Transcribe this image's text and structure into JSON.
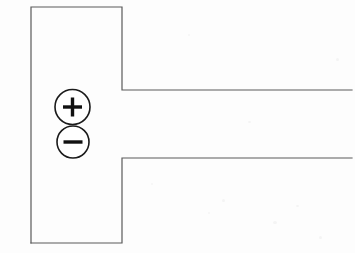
{
  "canvas": {
    "width": 355,
    "height": 253,
    "background_color": "#fdfdfd",
    "stroke_color": "#5a5a5a",
    "symbol_color": "#111111",
    "stroke_width": 1.2,
    "circle_stroke_width": 1.6,
    "description": "Scanned line drawing of an open T-shaped outline with plus and minus control circles"
  },
  "diagram": {
    "outline": {
      "name": "t-shaped-outline",
      "top_path": "M 31 243 L 31 7 L 122 7 L 122 90 L 352 90",
      "bottom_path": "M 31 243 L 122 243 L 122 158 L 352 158",
      "vertical_bar": {
        "left": 31,
        "top": 7,
        "right": 122,
        "bottom": 243
      },
      "top_arm": {
        "y": 90,
        "x_start": 122,
        "x_end": 352
      },
      "bottom_arm": {
        "y": 158,
        "x_start": 122,
        "x_end": 352
      },
      "gap_note": "right edge of the vertical bar is open between y=90 and y=158"
    },
    "controls": [
      {
        "name": "zoom-in-button",
        "symbol": "plus",
        "label": "+",
        "cx": 72.5,
        "cy": 107,
        "r": 17.5,
        "bar_length": 19,
        "bar_thickness": 3.4
      },
      {
        "name": "zoom-out-button",
        "symbol": "minus",
        "label": "−",
        "cx": 73,
        "cy": 142,
        "r": 16,
        "bar_length": 19,
        "bar_thickness": 3.4
      }
    ]
  },
  "specks": [
    {
      "x": 222,
      "y": 199,
      "w": 3,
      "h": 3
    },
    {
      "x": 208,
      "y": 212,
      "w": 2,
      "h": 2
    },
    {
      "x": 273,
      "y": 221,
      "w": 4,
      "h": 3
    },
    {
      "x": 296,
      "y": 205,
      "w": 3,
      "h": 2
    },
    {
      "x": 319,
      "y": 236,
      "w": 3,
      "h": 3
    },
    {
      "x": 336,
      "y": 58,
      "w": 3,
      "h": 3
    },
    {
      "x": 188,
      "y": 34,
      "w": 2,
      "h": 2
    },
    {
      "x": 248,
      "y": 121,
      "w": 3,
      "h": 2
    },
    {
      "x": 151,
      "y": 183,
      "w": 2,
      "h": 2
    }
  ]
}
